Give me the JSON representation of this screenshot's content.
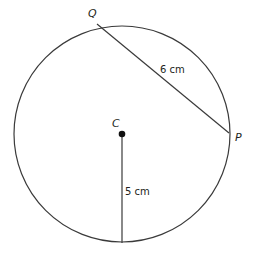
{
  "diagram": {
    "type": "circle-geometry",
    "colors": {
      "stroke": "#3a3a3a",
      "text": "#231f20",
      "background": "#ffffff"
    },
    "circle": {
      "cx": 122,
      "cy": 134,
      "r": 108
    },
    "points": {
      "Q": {
        "label": "Q",
        "x": 97,
        "y": 24
      },
      "P": {
        "label": "P",
        "x": 229,
        "y": 133
      },
      "C": {
        "label": "C",
        "x": 122,
        "y": 134
      },
      "bottom": {
        "x": 122,
        "y": 243
      }
    },
    "segments": [
      {
        "from": "Q",
        "to": "P",
        "label": "6 cm"
      },
      {
        "from": "C",
        "to": "bottom",
        "label": "5 cm"
      }
    ],
    "labels": {
      "Q": "Q",
      "P": "P",
      "C": "C",
      "chord": "6 cm",
      "radius": "5 cm"
    }
  }
}
